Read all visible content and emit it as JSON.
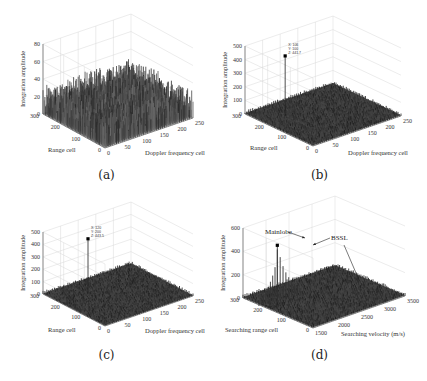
{
  "chart_data": [
    {
      "id": "a",
      "type": "surface3d",
      "caption": "(a)",
      "zlabel": "Integration amplitude",
      "xlabel": "Doppler frequency cell",
      "ylabel": "Range cell",
      "zticks": [
        "0",
        "20",
        "40",
        "60",
        "80"
      ],
      "xticks": [
        "0",
        "50",
        "100",
        "150",
        "200",
        "250"
      ],
      "yticks": [
        "0",
        "100",
        "200",
        "300"
      ],
      "zlim": [
        0,
        80
      ],
      "xlim": [
        0,
        256
      ],
      "ylim": [
        0,
        300
      ],
      "description": "Noise-like surface with amplitudes mostly 10-40, occasional spikes up to ~60; no visible target peak"
    },
    {
      "id": "b",
      "type": "surface3d",
      "caption": "(b)",
      "zlabel": "Integration amplitude",
      "xlabel": "Doppler frequency cell",
      "ylabel": "Range cell",
      "zticks": [
        "0",
        "100",
        "200",
        "300",
        "400",
        "500"
      ],
      "xticks": [
        "0",
        "50",
        "100",
        "150",
        "200",
        "250"
      ],
      "yticks": [
        "0",
        "100",
        "200",
        "300"
      ],
      "zlim": [
        0,
        500
      ],
      "peak": {
        "X": "106",
        "Y": "100",
        "Z": "441.7"
      },
      "datatip": [
        "X: 106",
        "Y: 100",
        "Z: 441.7"
      ]
    },
    {
      "id": "c",
      "type": "surface3d",
      "caption": "(c)",
      "zlabel": "Integration amplitude",
      "xlabel": "Doppler frequency cell",
      "ylabel": "Range cell",
      "zticks": [
        "0",
        "100",
        "200",
        "300",
        "400",
        "500"
      ],
      "xticks": [
        "0",
        "50",
        "100",
        "150",
        "200",
        "250"
      ],
      "yticks": [
        "0",
        "100",
        "200",
        "300"
      ],
      "zlim": [
        0,
        500
      ],
      "peak": {
        "X": "120",
        "Y": "200",
        "Z": "443.5"
      },
      "datatip": [
        "X: 120",
        "Y: 200",
        "Z: 443.5"
      ]
    },
    {
      "id": "d",
      "type": "surface3d",
      "caption": "(d)",
      "zlabel": "Integration amplitude",
      "xlabel": "Searching velocity (m/s)",
      "ylabel": "Searching range cell",
      "zticks": [
        "0",
        "200",
        "400",
        "600"
      ],
      "xticks": [
        "1500",
        "2000",
        "2500",
        "3000",
        "3500"
      ],
      "yticks": [
        "0",
        "100",
        "200",
        "300"
      ],
      "zlim": [
        0,
        600
      ],
      "annotations": [
        "Mainlobe",
        "BSSL"
      ],
      "description": "Mainlobe peak ~520 with a series of decaying sidelobe spikes; BSSL arrows point along the blind-speed sidelobe ridge"
    }
  ]
}
